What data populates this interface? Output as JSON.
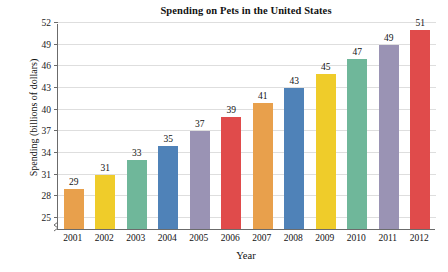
{
  "chart_data": {
    "type": "bar",
    "title": "Spending on Pets in the United States",
    "xlabel": "Year",
    "ylabel": "Spending (billions of dollars)",
    "categories": [
      "2001",
      "2002",
      "2003",
      "2004",
      "2005",
      "2006",
      "2007",
      "2008",
      "2009",
      "2010",
      "2011",
      "2012"
    ],
    "values": [
      29,
      31,
      33,
      35,
      37,
      39,
      41,
      43,
      45,
      47,
      49,
      51
    ],
    "value_labels": [
      "29",
      "31",
      "33",
      "35",
      "37",
      "39",
      "41",
      "43",
      "45",
      "47",
      "49",
      "51"
    ],
    "ylim": [
      23.5,
      52
    ],
    "yticks": [
      25,
      28,
      31,
      34,
      37,
      40,
      43,
      46,
      49,
      52
    ],
    "ytick_labels": [
      "25",
      "28",
      "31",
      "34",
      "37",
      "40",
      "43",
      "46",
      "49",
      "52"
    ],
    "axis_break": true,
    "grid": "horizontal",
    "legend": "none",
    "bar_colors": [
      "#E8A04C",
      "#EFCC2A",
      "#6FB79A",
      "#4F82B8",
      "#9A93B4",
      "#E04B4B",
      "#E8A04C",
      "#4F82B8",
      "#EFCC2A",
      "#6FB79A",
      "#9A93B4",
      "#E04B4B"
    ],
    "colors": {
      "background": "#FFFFFF",
      "axis": "#6B6B6B",
      "gridline": "#DEDEDE",
      "text": "#121212"
    }
  }
}
